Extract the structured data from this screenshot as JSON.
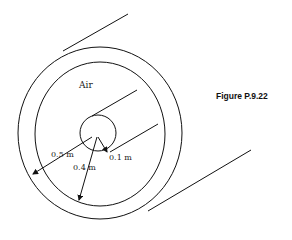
{
  "figure": {
    "caption": "Figure P.9.22",
    "region_label": "Air",
    "dimensions": [
      {
        "name": "outer-radius",
        "label": "0.5 m"
      },
      {
        "name": "inner-shell-radius",
        "label": "0.4 m"
      },
      {
        "name": "conductor-radius",
        "label": "0.1 m"
      }
    ]
  }
}
